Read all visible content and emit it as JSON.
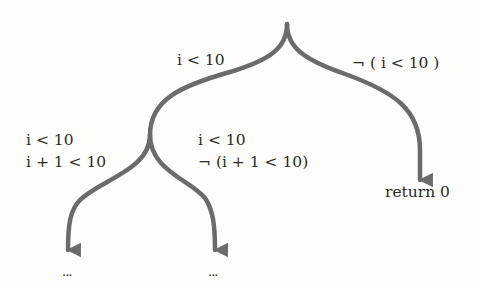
{
  "diagram": {
    "type": "decision-tree",
    "edge_color": "#6b6b6b",
    "root": {
      "branches": [
        {
          "label": "i < 10",
          "children": [
            {
              "condition_lines": [
                "i < 10",
                "i + 1 < 10"
              ],
              "result": "..."
            },
            {
              "condition_lines": [
                "i < 10",
                "¬ (i + 1 < 10)"
              ],
              "result": "..."
            }
          ]
        },
        {
          "label": "¬ ( i < 10 )",
          "result": "return 0"
        }
      ]
    }
  }
}
